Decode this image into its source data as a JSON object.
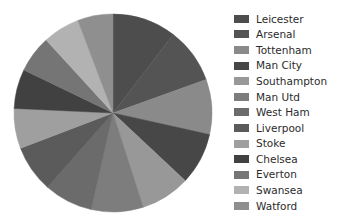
{
  "chart_data": {
    "type": "pie",
    "title": "",
    "subtitle": "",
    "xlabel": "",
    "ylabel": "",
    "grid": false,
    "legend_position": "right",
    "start_angle_deg": 90,
    "direction": "clockwise",
    "categories": [
      "Leicester",
      "Arsenal",
      "Tottenham",
      "Man City",
      "Southampton",
      "Man Utd",
      "West Ham",
      "Liverpool",
      "Stoke",
      "Chelsea",
      "Everton",
      "Swansea",
      "Watford"
    ],
    "values": [
      81,
      71,
      70,
      66,
      63,
      66,
      62,
      60,
      51,
      50,
      47,
      47,
      45
    ],
    "colors": [
      "#4d4d4d",
      "#545454",
      "#8a8a8a",
      "#474747",
      "#989898",
      "#7d7d7d",
      "#6b6b6b",
      "#5b5b5b",
      "#9f9f9f",
      "#414141",
      "#757575",
      "#b2b2b2",
      "#8f8f8f"
    ],
    "slice_colors_ordered": [
      "#4d4d4d",
      "#545454",
      "#8a8a8a",
      "#474747",
      "#989898",
      "#7d7d7d",
      "#6b6b6b",
      "#5b5b5b",
      "#9f9f9f",
      "#414141",
      "#757575",
      "#b2b2b2",
      "#8f8f8f"
    ]
  },
  "legend": {
    "items": [
      {
        "label": "Leicester",
        "color": "#4d4d4d"
      },
      {
        "label": "Arsenal",
        "color": "#545454"
      },
      {
        "label": "Tottenham",
        "color": "#8a8a8a"
      },
      {
        "label": "Man City",
        "color": "#474747"
      },
      {
        "label": "Southampton",
        "color": "#989898"
      },
      {
        "label": "Man Utd",
        "color": "#7d7d7d"
      },
      {
        "label": "West Ham",
        "color": "#6b6b6b"
      },
      {
        "label": "Liverpool",
        "color": "#5b5b5b"
      },
      {
        "label": "Stoke",
        "color": "#9f9f9f"
      },
      {
        "label": "Chelsea",
        "color": "#414141"
      },
      {
        "label": "Everton",
        "color": "#757575"
      },
      {
        "label": "Swansea",
        "color": "#b2b2b2"
      },
      {
        "label": "Watford",
        "color": "#8f8f8f"
      }
    ]
  },
  "pie_geometry": {
    "center_x": 113,
    "center_y": 113,
    "radius": 99
  }
}
